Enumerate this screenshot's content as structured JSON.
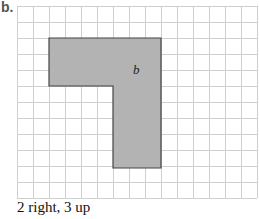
{
  "part_label": "b.",
  "shape_label": "b",
  "caption": "2 right, 3 up",
  "grid": {
    "cols": 15,
    "rows": 12,
    "cell": 16,
    "origin": [
      17,
      6
    ],
    "line_color": "#cfcfcf"
  },
  "shape": {
    "fill": "#b3b3b3",
    "stroke": "#444444",
    "cells": "L-shape: rows 2-5 cols 2-9, rows 5-10 cols 6-9"
  }
}
